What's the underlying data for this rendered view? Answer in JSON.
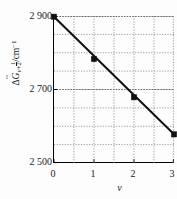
{
  "chart_data": {
    "type": "scatter",
    "title": "",
    "subtitle": "",
    "xlabel": "v",
    "ylabel_plain": "ΔG̃(v+1/2) / cm^-1",
    "ylabel_parts": {
      "delta": "Δ",
      "symbol": "G",
      "subscript_var": "v+",
      "subscript_frac_num": "1",
      "subscript_frac_den": "2",
      "units": "/cm",
      "units_exponent": "−1"
    },
    "x": [
      0,
      1,
      2,
      3
    ],
    "values": [
      2898,
      2783,
      2679,
      2578
    ],
    "series": [
      {
        "name": "ΔG̃(v+1/2)",
        "values": [
          2898,
          2783,
          2679,
          2578
        ],
        "marker": "filled-square",
        "marker_color": "#111111",
        "line_color": "#111111"
      }
    ],
    "fit_line": {
      "x_start": 0,
      "y_start": 2898,
      "x_end": 3,
      "y_end": 2578
    },
    "xlim": [
      0,
      3
    ],
    "ylim": [
      2500,
      2900
    ],
    "xticks": [
      0,
      1,
      2,
      3
    ],
    "xtick_labels": [
      "0",
      "1",
      "2",
      "3"
    ],
    "yticks": [
      2500,
      2700,
      2900
    ],
    "ytick_labels": [
      "2 500",
      "2 700",
      "2 900"
    ],
    "x_minor_gridlines": [
      0.5,
      1,
      1.5,
      2,
      2.5,
      3
    ],
    "y_minor_gridlines": [
      2550,
      2600,
      2650,
      2700,
      2750,
      2800,
      2850,
      2900
    ],
    "grid": true,
    "grid_style": "dotted",
    "grid_color": "#999999",
    "legend": null,
    "legend_position": "none",
    "axis_color": "#000000",
    "background_color": "#ffffff"
  }
}
